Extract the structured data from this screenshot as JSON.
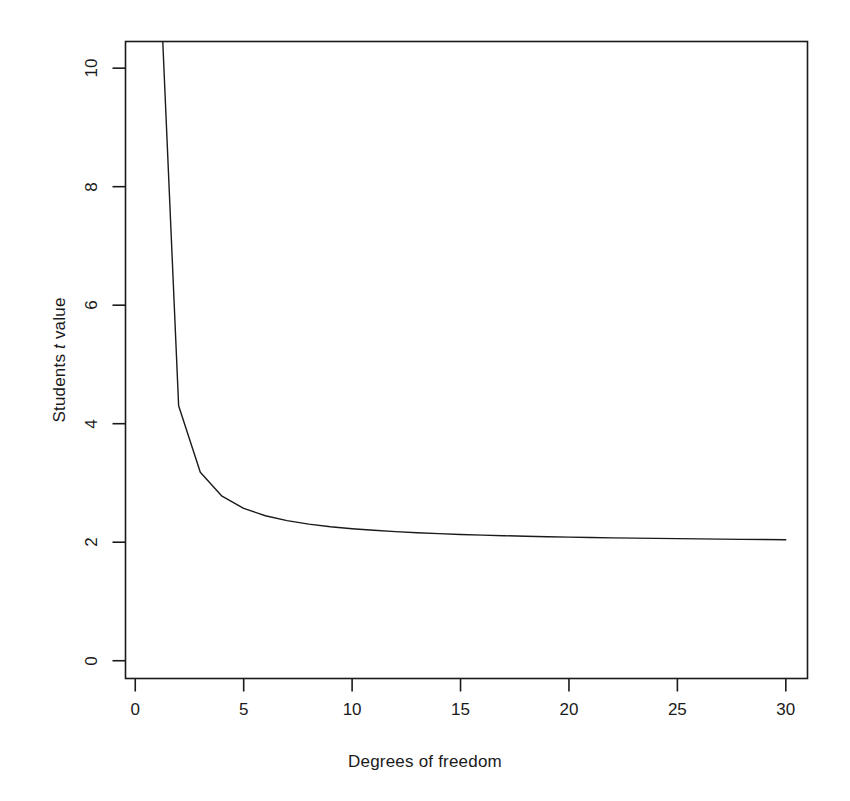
{
  "chart_data": {
    "type": "line",
    "title": "",
    "subtitle": "",
    "xlabel": "Degrees of freedom",
    "ylabel_parts": {
      "pre": "Students ",
      "italic": "t",
      "post": " value"
    },
    "ylabel": "Students t value",
    "xlim": [
      -0.45,
      31.0
    ],
    "ylim": [
      -0.3,
      10.45
    ],
    "xticks": [
      0,
      5,
      10,
      15,
      20,
      25,
      30
    ],
    "xtick_labels": [
      "0",
      "5",
      "10",
      "15",
      "20",
      "25",
      "30"
    ],
    "yticks": [
      0,
      2,
      4,
      6,
      8,
      10
    ],
    "ytick_labels": [
      "0",
      "2",
      "4",
      "6",
      "8",
      "10"
    ],
    "grid": false,
    "legend": null,
    "line_color": "#1a1a1a",
    "line_width": 1.4,
    "series": [
      {
        "name": "Students t critical value (two-tailed, alpha = 0.05)",
        "x": [
          1,
          2,
          3,
          4,
          5,
          6,
          7,
          8,
          9,
          10,
          11,
          12,
          13,
          14,
          15,
          16,
          17,
          18,
          19,
          20,
          21,
          22,
          23,
          24,
          25,
          26,
          27,
          28,
          29,
          30
        ],
        "values": [
          12.706,
          4.303,
          3.182,
          2.776,
          2.571,
          2.447,
          2.365,
          2.306,
          2.262,
          2.228,
          2.201,
          2.179,
          2.16,
          2.145,
          2.131,
          2.12,
          2.11,
          2.101,
          2.093,
          2.086,
          2.08,
          2.074,
          2.069,
          2.064,
          2.06,
          2.056,
          2.052,
          2.048,
          2.045,
          2.042
        ]
      }
    ]
  },
  "axes": {
    "frame": true,
    "frame_color": "#1a1a1a"
  }
}
